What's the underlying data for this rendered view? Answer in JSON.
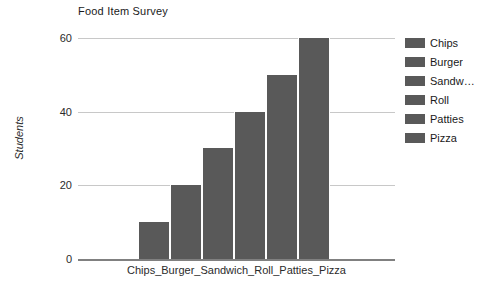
{
  "chart_data": {
    "type": "bar",
    "title": "Food Item Survey",
    "categories": [
      "Chips",
      "Burger",
      "Sandwich",
      "Roll",
      "Patties",
      "Pizza"
    ],
    "values": [
      10,
      20,
      30,
      40,
      50,
      60
    ],
    "xlabel": "Chips_Burger_Sandwich_Roll_Patties_Pizza",
    "ylabel": "Students",
    "ylim": [
      0,
      60
    ],
    "yticks": [
      0,
      20,
      40,
      60
    ],
    "ytick_labels": [
      "0",
      "20",
      "40",
      "60"
    ],
    "grid": true,
    "legend_position": "right",
    "legend_entries": [
      {
        "label": "Chips",
        "color": "#595959"
      },
      {
        "label": "Burger",
        "color": "#595959"
      },
      {
        "label": "Sandw…",
        "color": "#595959"
      },
      {
        "label": "Roll",
        "color": "#595959"
      },
      {
        "label": "Patties",
        "color": "#595959"
      },
      {
        "label": "Pizza",
        "color": "#595959"
      }
    ],
    "bar_color": "#595959",
    "gridline_color": "#c8c8c8",
    "axis_color": "#808080",
    "background_color": "#ffffff"
  }
}
